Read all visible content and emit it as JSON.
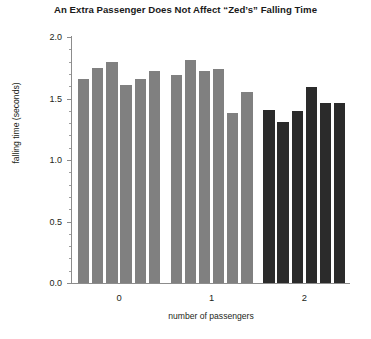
{
  "chart_data": {
    "type": "bar",
    "title": "An Extra Passenger Does Not Affect “Zed’s” Falling Time",
    "xlabel": "number of passengers",
    "ylabel": "falling time (seconds)",
    "ylim": [
      0.0,
      2.0
    ],
    "yticks": [
      0.0,
      0.5,
      1.0,
      1.5,
      2.0
    ],
    "ytick_labels": [
      "0.0",
      "0.5",
      "1.0",
      "1.5",
      "2.0"
    ],
    "yminor_step": 0.1,
    "grid": false,
    "legend": "none",
    "categories": [
      "0",
      "1",
      "2"
    ],
    "groups": [
      {
        "label": "0",
        "color": "#808080",
        "values": [
          1.66,
          1.75,
          1.8,
          1.61,
          1.66,
          1.72
        ]
      },
      {
        "label": "1",
        "color": "#808080",
        "values": [
          1.69,
          1.81,
          1.72,
          1.74,
          1.38,
          1.55
        ]
      },
      {
        "label": "2",
        "color": "#2b2b2b",
        "values": [
          1.41,
          1.31,
          1.4,
          1.59,
          1.46,
          1.46
        ]
      }
    ]
  }
}
